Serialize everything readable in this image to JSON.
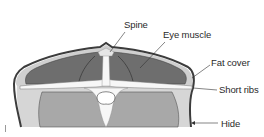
{
  "diagram": {
    "type": "anatomical cross-section",
    "colors": {
      "eye_muscle": "#6e6e6e",
      "lower_tissue": "#a9a9a9",
      "fat_cover": "#cfcfcf",
      "hide_outline": "#3c3c3c",
      "bone": "#f7f7f7",
      "background": "#ffffff"
    },
    "labels": [
      {
        "id": "spine",
        "text": "Spine"
      },
      {
        "id": "eye_muscle",
        "text": "Eye muscle"
      },
      {
        "id": "fat_cover",
        "text": "Fat cover"
      },
      {
        "id": "short_ribs",
        "text": "Short ribs"
      },
      {
        "id": "hide",
        "text": "Hide"
      }
    ]
  }
}
